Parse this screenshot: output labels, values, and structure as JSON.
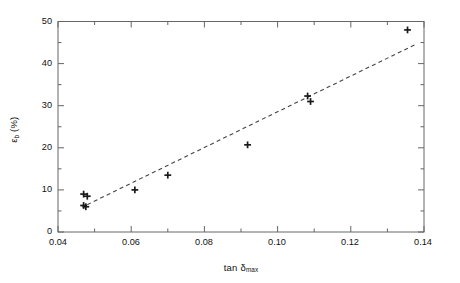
{
  "chart_data": {
    "type": "scatter",
    "title": "",
    "xlabel": "tan δ",
    "xlabel_sub": "max",
    "ylabel": "ε",
    "ylabel_sub": "b",
    "ylabel_unit": " (%)",
    "xlim": [
      0.04,
      0.14
    ],
    "ylim": [
      0,
      50
    ],
    "xticks": [
      0.04,
      0.06,
      0.08,
      0.1,
      0.12,
      0.14
    ],
    "xtick_labels": [
      "0.04",
      "0.06",
      "0.08",
      "0.10",
      "0.12",
      "0.14"
    ],
    "xtick_minor_step": 0.01,
    "yticks": [
      0,
      10,
      20,
      30,
      40,
      50
    ],
    "ytick_labels": [
      "0",
      "10",
      "20",
      "30",
      "40",
      "50"
    ],
    "ytick_minor_step": 5,
    "grid": false,
    "legend": false,
    "marker": "plus",
    "marker_color": "#1a1a1a",
    "line_color": "#444444",
    "line_style": "dashed",
    "x": [
      0.047,
      0.048,
      0.047,
      0.0476,
      0.061,
      0.07,
      0.0918,
      0.1082,
      0.109,
      0.1355
    ],
    "y": [
      9.0,
      8.5,
      6.3,
      6.0,
      10.0,
      13.5,
      20.7,
      32.3,
      31.0,
      48.0
    ],
    "points": [
      {
        "x": 0.047,
        "y": 9.0
      },
      {
        "x": 0.048,
        "y": 8.5
      },
      {
        "x": 0.047,
        "y": 6.3
      },
      {
        "x": 0.0476,
        "y": 6.0
      },
      {
        "x": 0.061,
        "y": 10.0
      },
      {
        "x": 0.07,
        "y": 13.5
      },
      {
        "x": 0.0918,
        "y": 20.7
      },
      {
        "x": 0.1082,
        "y": 32.3
      },
      {
        "x": 0.109,
        "y": 31.0
      },
      {
        "x": 0.1355,
        "y": 48.0
      }
    ],
    "trendline": {
      "style": "dashed",
      "x0": 0.048,
      "y0": 6.5,
      "x1": 0.1378,
      "y1": 44.6
    }
  }
}
